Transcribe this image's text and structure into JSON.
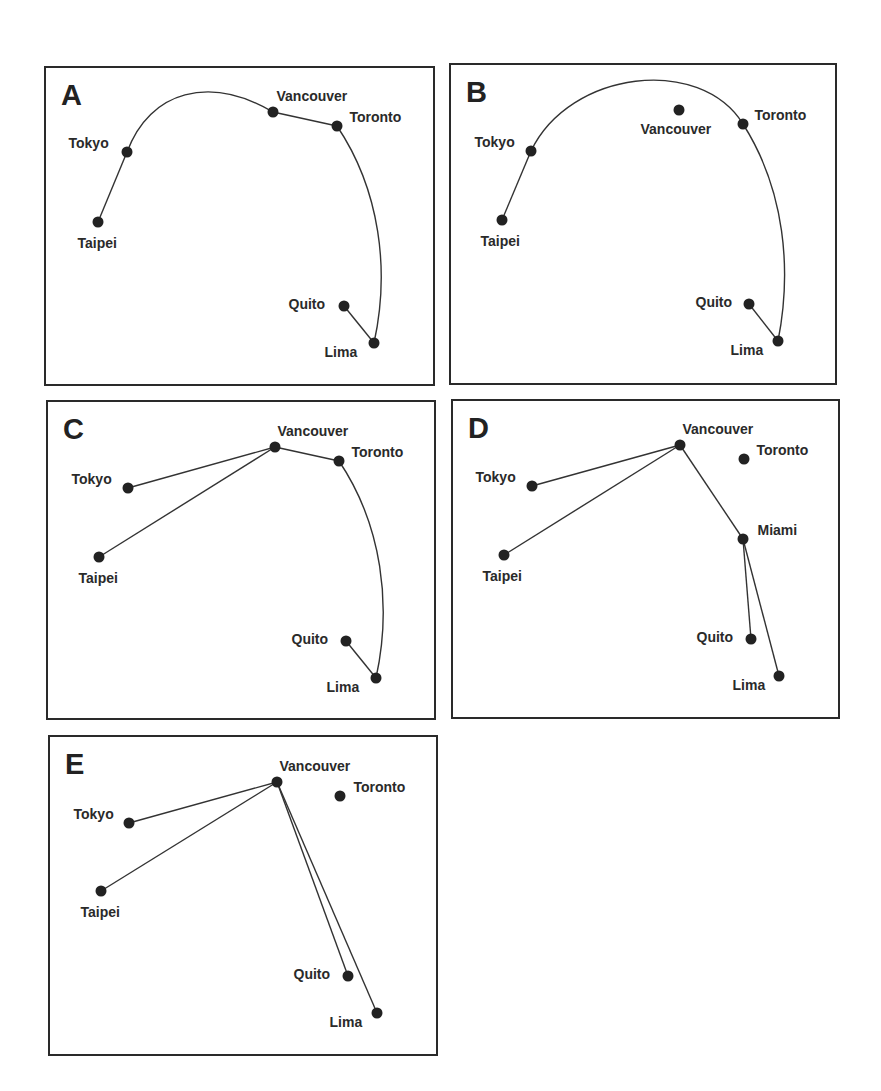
{
  "chart_data": {
    "type": "diagram",
    "panels": [
      {
        "letter": "A",
        "box": {
          "x": 44,
          "y": 66,
          "w": 391,
          "h": 320
        },
        "nodes": [
          {
            "name": "Tokyo",
            "x": 127,
            "y": 152,
            "lx": 69,
            "ly": 136
          },
          {
            "name": "Taipei",
            "x": 98,
            "y": 222,
            "lx": 78,
            "ly": 236
          },
          {
            "name": "Vancouver",
            "x": 273,
            "y": 112,
            "lx": 277,
            "ly": 89
          },
          {
            "name": "Toronto",
            "x": 337,
            "y": 126,
            "lx": 350,
            "ly": 110
          },
          {
            "name": "Quito",
            "x": 344,
            "y": 306,
            "lx": 289,
            "ly": 297
          },
          {
            "name": "Lima",
            "x": 374,
            "y": 343,
            "lx": 325,
            "ly": 345
          }
        ],
        "edges": [
          {
            "from": "Taipei",
            "to": "Tokyo",
            "curve": "straight"
          },
          {
            "from": "Tokyo",
            "to": "Vancouver",
            "curve": "arc",
            "path": "M127,152 C150,90 210,75 273,112"
          },
          {
            "from": "Vancouver",
            "to": "Toronto",
            "curve": "straight"
          },
          {
            "from": "Toronto",
            "to": "Lima",
            "curve": "arc",
            "path": "M337,126 C380,190 390,270 374,343"
          },
          {
            "from": "Quito",
            "to": "Lima",
            "curve": "straight"
          }
        ]
      },
      {
        "letter": "B",
        "box": {
          "x": 449,
          "y": 63,
          "w": 388,
          "h": 322
        },
        "nodes": [
          {
            "name": "Tokyo",
            "x": 531,
            "y": 151,
            "lx": 475,
            "ly": 135
          },
          {
            "name": "Taipei",
            "x": 502,
            "y": 220,
            "lx": 481,
            "ly": 234
          },
          {
            "name": "Vancouver",
            "x": 679,
            "y": 110,
            "lx": 641,
            "ly": 122
          },
          {
            "name": "Toronto",
            "x": 743,
            "y": 124,
            "lx": 755,
            "ly": 108
          },
          {
            "name": "Quito",
            "x": 749,
            "y": 304,
            "lx": 696,
            "ly": 295
          },
          {
            "name": "Lima",
            "x": 778,
            "y": 341,
            "lx": 731,
            "ly": 343
          }
        ],
        "edges": [
          {
            "from": "Taipei",
            "to": "Tokyo",
            "curve": "straight"
          },
          {
            "from": "Tokyo",
            "to": "Toronto",
            "curve": "arc",
            "path": "M531,151 C570,70 700,55 743,124"
          },
          {
            "from": "Toronto",
            "to": "Lima",
            "curve": "arc",
            "path": "M743,124 C785,190 792,270 778,341"
          },
          {
            "from": "Quito",
            "to": "Lima",
            "curve": "straight"
          }
        ]
      },
      {
        "letter": "C",
        "box": {
          "x": 46,
          "y": 400,
          "w": 390,
          "h": 320
        },
        "nodes": [
          {
            "name": "Tokyo",
            "x": 128,
            "y": 488,
            "lx": 72,
            "ly": 472
          },
          {
            "name": "Taipei",
            "x": 99,
            "y": 557,
            "lx": 79,
            "ly": 571
          },
          {
            "name": "Vancouver",
            "x": 275,
            "y": 447,
            "lx": 278,
            "ly": 424
          },
          {
            "name": "Toronto",
            "x": 339,
            "y": 461,
            "lx": 352,
            "ly": 445
          },
          {
            "name": "Quito",
            "x": 346,
            "y": 641,
            "lx": 292,
            "ly": 632
          },
          {
            "name": "Lima",
            "x": 376,
            "y": 678,
            "lx": 327,
            "ly": 680
          }
        ],
        "edges": [
          {
            "from": "Tokyo",
            "to": "Vancouver",
            "curve": "straight"
          },
          {
            "from": "Taipei",
            "to": "Vancouver",
            "curve": "straight"
          },
          {
            "from": "Vancouver",
            "to": "Toronto",
            "curve": "straight"
          },
          {
            "from": "Toronto",
            "to": "Lima",
            "curve": "arc",
            "path": "M339,461 C382,525 392,605 376,678"
          },
          {
            "from": "Quito",
            "to": "Lima",
            "curve": "straight"
          }
        ]
      },
      {
        "letter": "D",
        "box": {
          "x": 451,
          "y": 399,
          "w": 389,
          "h": 320
        },
        "nodes": [
          {
            "name": "Tokyo",
            "x": 532,
            "y": 486,
            "lx": 476,
            "ly": 470
          },
          {
            "name": "Taipei",
            "x": 504,
            "y": 555,
            "lx": 483,
            "ly": 569
          },
          {
            "name": "Vancouver",
            "x": 680,
            "y": 445,
            "lx": 683,
            "ly": 422
          },
          {
            "name": "Toronto",
            "x": 744,
            "y": 459,
            "lx": 757,
            "ly": 443
          },
          {
            "name": "Miami",
            "x": 743,
            "y": 539,
            "lx": 758,
            "ly": 523
          },
          {
            "name": "Quito",
            "x": 751,
            "y": 639,
            "lx": 697,
            "ly": 630
          },
          {
            "name": "Lima",
            "x": 779,
            "y": 676,
            "lx": 733,
            "ly": 678
          }
        ],
        "edges": [
          {
            "from": "Tokyo",
            "to": "Vancouver",
            "curve": "straight"
          },
          {
            "from": "Taipei",
            "to": "Vancouver",
            "curve": "straight"
          },
          {
            "from": "Vancouver",
            "to": "Miami",
            "curve": "straight"
          },
          {
            "from": "Miami",
            "to": "Quito",
            "curve": "straight"
          },
          {
            "from": "Miami",
            "to": "Lima",
            "curve": "straight"
          }
        ]
      },
      {
        "letter": "E",
        "box": {
          "x": 48,
          "y": 735,
          "w": 390,
          "h": 321
        },
        "nodes": [
          {
            "name": "Tokyo",
            "x": 129,
            "y": 823,
            "lx": 74,
            "ly": 807
          },
          {
            "name": "Taipei",
            "x": 101,
            "y": 891,
            "lx": 81,
            "ly": 905
          },
          {
            "name": "Vancouver",
            "x": 277,
            "y": 782,
            "lx": 280,
            "ly": 759
          },
          {
            "name": "Toronto",
            "x": 340,
            "y": 796,
            "lx": 354,
            "ly": 780
          },
          {
            "name": "Quito",
            "x": 348,
            "y": 976,
            "lx": 294,
            "ly": 967
          },
          {
            "name": "Lima",
            "x": 377,
            "y": 1013,
            "lx": 330,
            "ly": 1015
          }
        ],
        "edges": [
          {
            "from": "Tokyo",
            "to": "Vancouver",
            "curve": "straight"
          },
          {
            "from": "Taipei",
            "to": "Vancouver",
            "curve": "straight"
          },
          {
            "from": "Vancouver",
            "to": "Quito",
            "curve": "straight"
          },
          {
            "from": "Vancouver",
            "to": "Lima",
            "curve": "straight"
          }
        ]
      }
    ]
  },
  "style": {
    "line_color": "#333333",
    "node_color": "#222222",
    "node_radius": 5.5
  }
}
